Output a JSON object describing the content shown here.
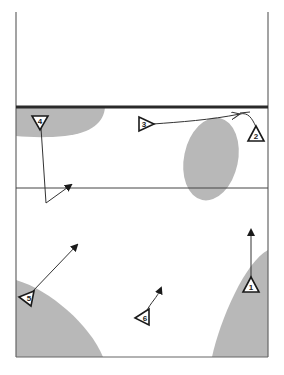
{
  "diagram": {
    "type": "volleyball-court-play-diagram",
    "colors": {
      "court_line": "#555555",
      "net": "#2a2a2a",
      "zone_fill": "#b8b8b8",
      "marker_stroke": "#1a1a1a",
      "arrow": "#333333"
    },
    "players": [
      {
        "id": "1",
        "label": "1",
        "x": 251,
        "y": 285,
        "orientation": "up"
      },
      {
        "id": "2",
        "label": "2",
        "x": 256,
        "y": 133,
        "orientation": "up"
      },
      {
        "id": "3",
        "label": "3",
        "x": 146,
        "y": 124,
        "orientation": "left"
      },
      {
        "id": "4",
        "label": "4",
        "x": 40,
        "y": 123,
        "orientation": "down"
      },
      {
        "id": "5",
        "label": "5",
        "x": 28,
        "y": 297,
        "orientation": "left"
      },
      {
        "id": "6",
        "label": "6",
        "x": 143,
        "y": 317,
        "orientation": "left"
      }
    ],
    "movements": [
      {
        "player": "1",
        "description": "straight up"
      },
      {
        "player": "3",
        "description": "curved to right along net"
      },
      {
        "player": "4",
        "description": "down then diagonal to right"
      },
      {
        "player": "5",
        "description": "diagonal up-right"
      },
      {
        "player": "6",
        "description": "short curved up-right"
      }
    ]
  }
}
